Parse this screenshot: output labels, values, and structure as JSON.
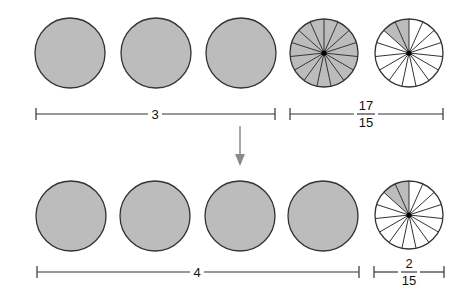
{
  "diagram": {
    "top_row": {
      "whole_circles": 3,
      "whole_label": "3",
      "fraction_label": {
        "numerator": "17",
        "denominator": "15"
      },
      "fraction_circles": [
        {
          "segments": 15,
          "shaded": 15
        },
        {
          "segments": 15,
          "shaded": 2
        }
      ]
    },
    "arrow": "down-arrow",
    "bottom_row": {
      "whole_circles": 4,
      "whole_label": "4",
      "fraction_label": {
        "numerator": "2",
        "denominator": "15"
      },
      "fraction_circles": [
        {
          "segments": 15,
          "shaded": 2
        }
      ]
    },
    "colors": {
      "shade": "#bcbcbc",
      "stroke": "#333333",
      "arrow": "#8a8a8a"
    }
  }
}
